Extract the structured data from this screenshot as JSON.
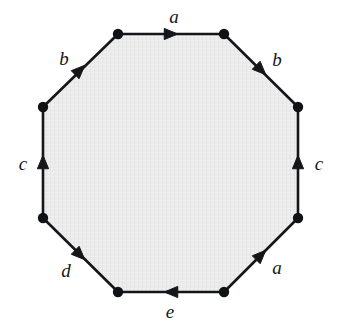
{
  "figure": {
    "type": "polygon-edge-identification-diagram",
    "shape_name": "octagon",
    "vertex_count": 8,
    "edge_count": 8,
    "colors": {
      "interior_fill": "#ebebeb",
      "edge_stroke": "#15161a",
      "vertex_dot": "#111216",
      "label_text": "#15161a",
      "background": "#ffffff"
    },
    "style": {
      "edge_stroke_width": 2.6,
      "vertex_dot_radius": 5.2,
      "label_font_size_px": 19,
      "label_font_style": "italic-serif"
    },
    "vertices": [
      {
        "name": "top-left",
        "x": 118,
        "y": 34
      },
      {
        "name": "top-right",
        "x": 224,
        "y": 34
      },
      {
        "name": "right-upper",
        "x": 298,
        "y": 107
      },
      {
        "name": "right-lower",
        "x": 298,
        "y": 218
      },
      {
        "name": "bottom-right",
        "x": 224,
        "y": 292
      },
      {
        "name": "bottom-left",
        "x": 118,
        "y": 292
      },
      {
        "name": "left-lower",
        "x": 43,
        "y": 218
      },
      {
        "name": "left-upper",
        "x": 43,
        "y": 107
      }
    ],
    "edges": [
      {
        "id": "edge-top",
        "label": "a",
        "position": "top",
        "from": "top-left",
        "to": "top-right",
        "arrow_direction": "right",
        "arrow_at": {
          "x": 171,
          "y": 34
        },
        "label_at": {
          "x": 174,
          "y": 16
        }
      },
      {
        "id": "edge-top-right",
        "label": "b",
        "position": "top-right",
        "from": "top-right",
        "to": "right-upper",
        "arrow_direction": "down-right",
        "arrow_at": {
          "x": 261,
          "y": 70
        },
        "label_at": {
          "x": 277,
          "y": 59
        }
      },
      {
        "id": "edge-right",
        "label": "c",
        "position": "right",
        "from": "right-lower",
        "to": "right-upper",
        "arrow_direction": "up",
        "arrow_at": {
          "x": 298,
          "y": 162
        },
        "label_at": {
          "x": 319,
          "y": 163
        }
      },
      {
        "id": "edge-bottom-right",
        "label": "a",
        "position": "bottom-right",
        "from": "bottom-right",
        "to": "right-lower",
        "arrow_direction": "up-right",
        "arrow_at": {
          "x": 261,
          "y": 255
        },
        "label_at": {
          "x": 277,
          "y": 267
        }
      },
      {
        "id": "edge-bottom",
        "label": "e",
        "position": "bottom",
        "from": "bottom-right",
        "to": "bottom-left",
        "arrow_direction": "left",
        "arrow_at": {
          "x": 171,
          "y": 292
        },
        "label_at": {
          "x": 170,
          "y": 311
        }
      },
      {
        "id": "edge-bottom-left",
        "label": "d",
        "position": "bottom-left",
        "from": "left-lower",
        "to": "bottom-left",
        "arrow_direction": "down-right",
        "arrow_at": {
          "x": 80,
          "y": 255
        },
        "label_at": {
          "x": 66,
          "y": 270
        }
      },
      {
        "id": "edge-left",
        "label": "c",
        "position": "left",
        "from": "left-lower",
        "to": "left-upper",
        "arrow_direction": "up",
        "arrow_at": {
          "x": 43,
          "y": 162
        },
        "label_at": {
          "x": 23,
          "y": 163
        }
      },
      {
        "id": "edge-top-left",
        "label": "b",
        "position": "top-left",
        "from": "left-upper",
        "to": "top-left",
        "arrow_direction": "up-right",
        "arrow_at": {
          "x": 80,
          "y": 70
        },
        "label_at": {
          "x": 64,
          "y": 58
        }
      }
    ]
  }
}
